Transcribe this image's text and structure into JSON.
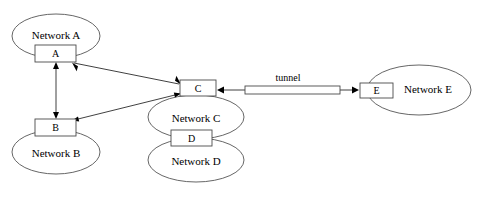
{
  "diagram": {
    "type": "network-topology",
    "title": "",
    "networks": [
      {
        "id": "net-a",
        "label": "Network A",
        "cx": 56,
        "cy": 36,
        "rx": 44,
        "ry": 22,
        "orientation": "wide"
      },
      {
        "id": "net-b",
        "label": "Network B",
        "cx": 56,
        "cy": 152,
        "rx": 44,
        "ry": 22,
        "orientation": "wide"
      },
      {
        "id": "net-c",
        "label": "Network C",
        "cx": 196,
        "cy": 117,
        "rx": 48,
        "ry": 22,
        "orientation": "wide"
      },
      {
        "id": "net-d",
        "label": "Network D",
        "cx": 196,
        "cy": 160,
        "rx": 48,
        "ry": 22,
        "orientation": "wide"
      },
      {
        "id": "net-e",
        "label": "Network E",
        "cx": 419,
        "cy": 90,
        "rx": 52,
        "ry": 25,
        "orientation": "wide"
      }
    ],
    "routers": [
      {
        "id": "router-a",
        "label": "A",
        "x": 35,
        "y": 45,
        "w": 41,
        "h": 17
      },
      {
        "id": "router-b",
        "label": "B",
        "x": 35,
        "y": 119,
        "w": 41,
        "h": 17
      },
      {
        "id": "router-c",
        "label": "C",
        "x": 180,
        "y": 80,
        "w": 36,
        "h": 16
      },
      {
        "id": "router-d",
        "label": "D",
        "x": 171,
        "y": 130,
        "w": 41,
        "h": 16
      },
      {
        "id": "router-e",
        "label": "E",
        "x": 360,
        "y": 83,
        "w": 33,
        "h": 15
      }
    ],
    "links": [
      {
        "id": "link-a-b",
        "from": "router-a",
        "to": "router-b",
        "arrows": "both",
        "label": ""
      },
      {
        "id": "link-a-c",
        "from": "router-a",
        "to": "router-c",
        "arrows": "both",
        "label": ""
      },
      {
        "id": "link-b-c",
        "from": "router-b",
        "to": "router-c",
        "arrows": "both",
        "label": ""
      },
      {
        "id": "link-c-e",
        "from": "router-c",
        "to": "router-e",
        "arrows": "both",
        "label": "tunnel"
      }
    ],
    "tunnel": {
      "label": "tunnel",
      "x": 245,
      "y": 86,
      "w": 95,
      "h": 8,
      "label_x": 288,
      "label_y": 81
    },
    "colors": {
      "background": "#ffffff",
      "ellipse_stroke": "#555555",
      "box_stroke": "#4a4a4a",
      "line_stroke": "#2b2b2b",
      "text": "#000000"
    }
  }
}
